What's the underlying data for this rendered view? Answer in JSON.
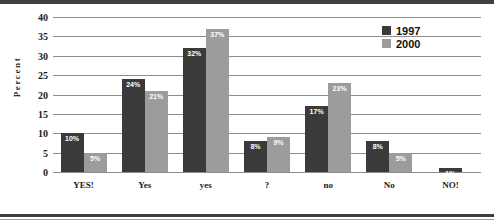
{
  "chart_data": {
    "type": "bar",
    "title": "",
    "xlabel": "",
    "ylabel": "Percent",
    "ylim": [
      0,
      40
    ],
    "ytick_step": 5,
    "yticks": [
      40,
      35,
      30,
      25,
      20,
      15,
      10,
      5,
      0
    ],
    "grid": true,
    "legend_position": "top-right",
    "categories": [
      "YES!",
      "Yes",
      "yes",
      "?",
      "no",
      "No",
      "NO!"
    ],
    "series": [
      {
        "name": "1997",
        "color": "#3a3a3a",
        "values": [
          10,
          24,
          32,
          8,
          17,
          8,
          1
        ],
        "labels": [
          "10%",
          "24%",
          "32%",
          "8%",
          "17%",
          "8%",
          "1%"
        ]
      },
      {
        "name": "2000",
        "color": "#9c9c9c",
        "values": [
          5,
          21,
          37,
          9,
          23,
          5,
          0
        ],
        "labels": [
          "5%",
          "21%",
          "37%",
          "9%",
          "23%",
          "5%",
          ""
        ]
      }
    ]
  },
  "legend": {
    "entries": [
      {
        "label": "1997"
      },
      {
        "label": "2000"
      }
    ]
  }
}
